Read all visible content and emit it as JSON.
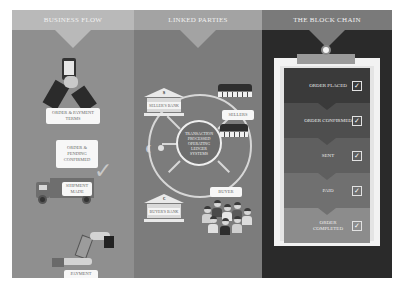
{
  "columns": {
    "left": {
      "title": "Business Flow",
      "steps": [
        {
          "label": "Order & Payment Terms",
          "icon": "smartphone-handshake-icon"
        },
        {
          "label": "Order & Pending Confirmed",
          "icon": "checkmark-icon"
        },
        {
          "label": "Shipment Made",
          "icon": "truck-icon"
        },
        {
          "label": "Payment Received",
          "icon": "money-handover-icon"
        }
      ]
    },
    "middle": {
      "title": "Linked Parties",
      "center": "Transaction Processed Operating Ledger Systems",
      "nodes": [
        {
          "label": "Seller's Bank",
          "icon": "bank-icon",
          "symbol": "$"
        },
        {
          "label": "Sellers",
          "icon": "storefront-icon"
        },
        {
          "label": "Buyer",
          "icon": "crowd-icon"
        },
        {
          "label": "Buyer's Bank",
          "icon": "bank-icon",
          "symbol": "€"
        }
      ],
      "signal_icon": "wireless-device-icon"
    },
    "right": {
      "title": "The Block Chain",
      "steps": [
        {
          "label": "Order Placed",
          "checked": true,
          "color": "#3a3a3a"
        },
        {
          "label": "Order Confirmed",
          "checked": true,
          "color": "#4e4e4e"
        },
        {
          "label": "Sent",
          "checked": true,
          "color": "#5f5f5f"
        },
        {
          "label": "Paid",
          "checked": true,
          "color": "#707070"
        },
        {
          "label": "Order Completed",
          "checked": true,
          "color": "#8c8c8c"
        }
      ],
      "check_glyph": "✓"
    }
  },
  "colors": {
    "left_bg": "#8f8f8f",
    "middle_bg": "#7c7c7c",
    "right_bg": "#2a2a2a"
  }
}
